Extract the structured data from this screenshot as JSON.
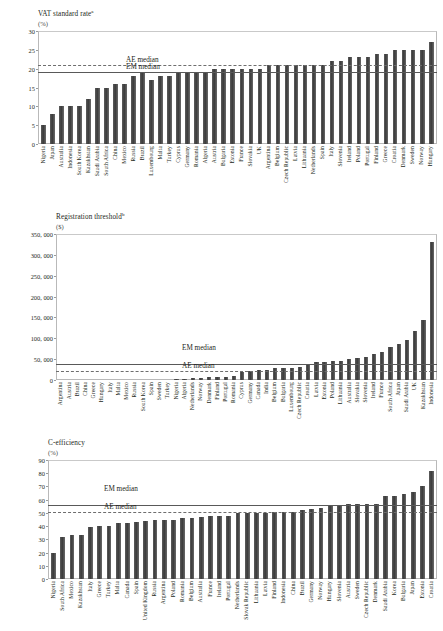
{
  "panels": [
    {
      "title": "VAT standard rate",
      "title_sup": "a",
      "unit": "(%)"
    },
    {
      "title": "Registration threshold",
      "title_sup": "b",
      "unit": "($)"
    },
    {
      "title": "C-efficiency",
      "title_sup": "",
      "unit": "(%)"
    }
  ],
  "median_labels": {
    "ae": "AE median",
    "em": "EM median"
  },
  "chart_data": [
    {
      "type": "bar",
      "title": "VAT standard rate",
      "xlabel": "",
      "ylabel": "(%)",
      "ylim": [
        0,
        30
      ],
      "yticks": [
        0,
        5,
        10,
        15,
        20,
        25,
        30
      ],
      "grid": false,
      "legend_position": "inline-annotations",
      "annotations": [
        {
          "label": "AE median",
          "value": 21.0,
          "style": "dashed"
        },
        {
          "label": "EM median",
          "value": 19.0,
          "style": "solid"
        }
      ],
      "categories": [
        "Nigeria",
        "Japan",
        "Australia",
        "Indonesia",
        "South Korea",
        "Kazakhstan",
        "Saudi Arabia",
        "South Africa",
        "China",
        "Mexico",
        "Russia",
        "Brazil",
        "Luxembourg",
        "Malta",
        "Turkey",
        "Cyprus",
        "Germany",
        "Romania",
        "Algeria",
        "Austria",
        "Bulgaria",
        "Estonia",
        "France",
        "Slovakia",
        "UK",
        "Argentina",
        "Belgium",
        "Czech Republic",
        "Latvia",
        "Lithuania",
        "Netherlands",
        "Spain",
        "Italy",
        "Slovenia",
        "Ireland",
        "Poland",
        "Portugal",
        "Finland",
        "Greece",
        "Croatia",
        "Denmark",
        "Sweden",
        "Norway",
        "Hungary"
      ],
      "values": [
        5,
        8,
        10,
        10,
        10,
        12,
        15,
        15,
        16,
        16,
        18,
        19,
        17,
        18,
        18,
        19,
        19,
        19,
        19,
        20,
        20,
        20,
        20,
        20,
        20,
        21,
        21,
        21,
        21,
        21,
        21,
        21,
        22,
        22,
        23,
        23,
        23,
        24,
        24,
        25,
        25,
        25,
        25,
        27
      ]
    },
    {
      "type": "bar",
      "title": "Registration threshold",
      "xlabel": "",
      "ylabel": "($)",
      "ylim": [
        0,
        350000
      ],
      "yticks": [
        0,
        50000,
        100000,
        150000,
        200000,
        250000,
        300000,
        350000
      ],
      "ytick_labels": [
        "0",
        "50, 000",
        "100, 000",
        "150, 000",
        "200, 000",
        "250, 000",
        "300, 000",
        "350, 000"
      ],
      "grid": false,
      "legend_position": "inline-annotations",
      "annotations": [
        {
          "label": "EM median",
          "value": 38000,
          "style": "solid"
        },
        {
          "label": "AE median",
          "value": 22000,
          "style": "dashed"
        }
      ],
      "categories": [
        "Argentina",
        "Austria",
        "Brazil",
        "China",
        "Greece",
        "Hungary",
        "Italy",
        "Malta",
        "Mexico",
        "Russia",
        "South Korea",
        "Spain",
        "Sweden",
        "Turkey",
        "Nigeria",
        "Algeria",
        "Netherlands",
        "Norway",
        "Denmark",
        "Finland",
        "Portugal",
        "Romania",
        "Cyprus",
        "Germany",
        "Canada",
        "India",
        "Belgium",
        "Bulgaria",
        "Luxembourg",
        "Czech Republic",
        "Croatia",
        "Latvia",
        "Estonia",
        "Poland",
        "Lithuania",
        "Australia",
        "Slovakia",
        "Slovenia",
        "Ireland",
        "France",
        "South Africa",
        "Japan",
        "Saudi Arabia",
        "UK",
        "Kazakhstan",
        "Indonesia"
      ],
      "values": [
        0,
        0,
        0,
        0,
        0,
        0,
        0,
        0,
        0,
        0,
        0,
        0,
        0,
        0,
        2000,
        3000,
        5000,
        6000,
        7000,
        8000,
        8000,
        9000,
        20000,
        22000,
        24000,
        25000,
        28000,
        28000,
        30000,
        32000,
        36000,
        42000,
        44000,
        45000,
        46000,
        50000,
        52000,
        56000,
        62000,
        68000,
        78000,
        86000,
        95000,
        118000,
        145000,
        330000
      ]
    },
    {
      "type": "bar",
      "title": "C-efficiency",
      "xlabel": "",
      "ylabel": "(%)",
      "ylim": [
        0,
        90
      ],
      "yticks": [
        0,
        10,
        20,
        30,
        40,
        50,
        60,
        70,
        80,
        90
      ],
      "grid": false,
      "legend_position": "inline-annotations",
      "annotations": [
        {
          "label": "EM median",
          "value": 56,
          "style": "solid"
        },
        {
          "label": "AE median",
          "value": 51,
          "style": "dashed"
        }
      ],
      "categories": [
        "Nigeria",
        "South Africa",
        "Mexico",
        "Kazakhstan",
        "Italy",
        "Greece",
        "Turkey",
        "Malta",
        "Canada",
        "Spain",
        "United Kingdom",
        "Russia",
        "Argentina",
        "Poland",
        "Romania",
        "Belgium",
        "Australia",
        "France",
        "Ireland",
        "Portugal",
        "Netherlands",
        "Slovak Republic",
        "Lithuania",
        "Latvia",
        "Finland",
        "Indonesia",
        "China",
        "Brazil",
        "Germany",
        "Norway",
        "Hungary",
        "Slovenia",
        "Austria",
        "Sweden",
        "Czech Republic",
        "Denmark",
        "Saudi Arabia",
        "Korea",
        "Bulgaria",
        "Japan",
        "Estonia",
        "Croatia"
      ],
      "values": [
        20,
        32,
        33,
        33,
        39,
        40,
        40,
        42,
        42,
        43,
        44,
        45,
        45,
        45,
        46,
        46,
        47,
        48,
        48,
        48,
        50,
        50,
        50,
        50,
        51,
        51,
        51,
        52,
        53,
        54,
        56,
        56,
        57,
        57,
        57,
        57,
        63,
        63,
        64,
        66,
        70,
        82
      ]
    }
  ]
}
